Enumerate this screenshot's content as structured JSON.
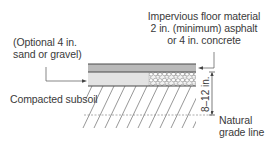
{
  "diagram": {
    "labels": {
      "optional_line1": "(Optional 4 in.",
      "optional_line2": "sand or gravel)",
      "impervious_line1": "Impervious floor material",
      "impervious_line2": "2 in. (minimum) asphalt",
      "impervious_line3": "or 4 in. concrete",
      "subsoil": "Compacted subsoil",
      "grade_line1": "Natural",
      "grade_line2": "grade line",
      "dimension": "8–12 in."
    },
    "colors": {
      "floor_layer": "#b9b9b9",
      "base_layer": "#e3e3e3",
      "outline": "#4a4a4a",
      "hatch": "#6a6a6a",
      "text": "#3a3a3a"
    }
  }
}
